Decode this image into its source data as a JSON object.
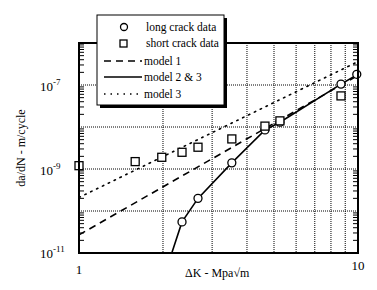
{
  "chart_data": {
    "type": "scatter",
    "title": "",
    "xlabel": "ΔK  - Mpa√m",
    "ylabel": "da/dN - m/cycle",
    "xscale": "log",
    "yscale": "log",
    "xlim": [
      1,
      10
    ],
    "ylim": [
      1e-11,
      1e-06
    ],
    "x_tick_labels": [
      "1",
      "10"
    ],
    "y_tick_labels": [
      {
        "base": "10",
        "exp": "-7",
        "value": 1e-07
      },
      {
        "base": "10",
        "exp": "-9",
        "value": 1e-09
      },
      {
        "base": "10",
        "exp": "-11",
        "value": 1e-11
      }
    ],
    "grid": true,
    "legend_position": "upper left (overlapping top of axes)",
    "series": [
      {
        "name": "long crack data",
        "kind": "markers",
        "marker": "circle",
        "points": [
          [
            2.34,
            5.5e-11
          ],
          [
            2.67,
            2e-10
          ],
          [
            3.53,
            1.4e-09
          ],
          [
            4.64,
            8.5e-09
          ],
          [
            5.25,
            1.3e-08
          ],
          [
            8.69,
            1.05e-07
          ],
          [
            9.9,
            1.8e-07
          ]
        ]
      },
      {
        "name": "short crack data",
        "kind": "markers",
        "marker": "square",
        "points": [
          [
            1.0,
            1.2e-09
          ],
          [
            1.59,
            1.5e-09
          ],
          [
            1.98,
            1.9e-09
          ],
          [
            2.34,
            2.5e-09
          ],
          [
            2.67,
            3.3e-09
          ],
          [
            3.53,
            5.2e-09
          ],
          [
            4.64,
            1.05e-08
          ],
          [
            5.25,
            1.4e-08
          ],
          [
            8.69,
            5.5e-08
          ]
        ]
      },
      {
        "name": "model 1",
        "kind": "line",
        "style": "dashed",
        "points": [
          [
            1.0,
            2.7e-11
          ],
          [
            10.0,
            1.7e-07
          ]
        ]
      },
      {
        "name": "model 2 & 3",
        "kind": "line",
        "style": "solid",
        "points": [
          [
            2.15,
            1e-11
          ],
          [
            2.34,
            5.5e-11
          ],
          [
            2.67,
            2e-10
          ],
          [
            3.53,
            1.4e-09
          ],
          [
            4.64,
            8.5e-09
          ],
          [
            5.25,
            1.3e-08
          ],
          [
            8.69,
            1.05e-07
          ],
          [
            10.0,
            1.8e-07
          ]
        ]
      },
      {
        "name": "model 3",
        "kind": "line",
        "style": "dotted",
        "points": [
          [
            1.0,
            2.1e-10
          ],
          [
            10.0,
            3.6e-07
          ]
        ]
      }
    ]
  },
  "legend": {
    "items": [
      {
        "label": "long crack data",
        "symbol": "circle"
      },
      {
        "label": "short crack data",
        "symbol": "square"
      },
      {
        "label": "model 1",
        "symbol": "dashed-line"
      },
      {
        "label": "model 2 & 3",
        "symbol": "solid-line"
      },
      {
        "label": "model 3",
        "symbol": "dotted-line"
      }
    ]
  },
  "axes": {
    "x_title": "ΔK  - Mpa√m",
    "y_title": "da/dN - m/cycle",
    "x_ticks": {
      "left": "1",
      "right": "10"
    },
    "y_ticks": {
      "t7": {
        "base": "10",
        "exp": "-7"
      },
      "t9": {
        "base": "10",
        "exp": "-9"
      },
      "t11": {
        "base": "10",
        "exp": "-11"
      }
    }
  }
}
